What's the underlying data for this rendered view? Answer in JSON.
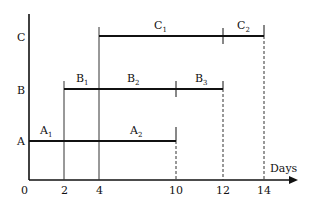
{
  "diagram": {
    "type": "gantt-schedule",
    "x_axis_label": "Days",
    "x_ticks": [
      {
        "label": "0",
        "x": 29
      },
      {
        "label": "2",
        "x": 64
      },
      {
        "label": "4",
        "x": 99
      },
      {
        "label": "10",
        "x": 176
      },
      {
        "label": "12",
        "x": 223
      },
      {
        "label": "14",
        "x": 264
      }
    ],
    "rows": [
      {
        "label": "C",
        "y": 36
      },
      {
        "label": "B",
        "y": 89
      },
      {
        "label": "A",
        "y": 141
      }
    ],
    "activities": [
      {
        "row": "A",
        "name": "A",
        "sub": "1",
        "start": 0,
        "end": 2
      },
      {
        "row": "A",
        "name": "A",
        "sub": "2",
        "start": 2,
        "end": 10
      },
      {
        "row": "B",
        "name": "B",
        "sub": "1",
        "start": 2,
        "end": 4
      },
      {
        "row": "B",
        "name": "B",
        "sub": "2",
        "start": 4,
        "end": 10
      },
      {
        "row": "B",
        "name": "B",
        "sub": "3",
        "start": 10,
        "end": 12
      },
      {
        "row": "C",
        "name": "C",
        "sub": "1",
        "start": 4,
        "end": 12
      },
      {
        "row": "C",
        "name": "C",
        "sub": "2",
        "start": 12,
        "end": 14
      }
    ],
    "labels": {
      "row_c": "C",
      "row_b": "B",
      "row_a": "A",
      "origin": "0",
      "t2": "2",
      "t4": "4",
      "t10": "10",
      "t12": "12",
      "t14": "14",
      "days": "Days",
      "a": "A",
      "b": "B",
      "c": "C",
      "s1": "1",
      "s2": "2",
      "s3": "3"
    }
  }
}
